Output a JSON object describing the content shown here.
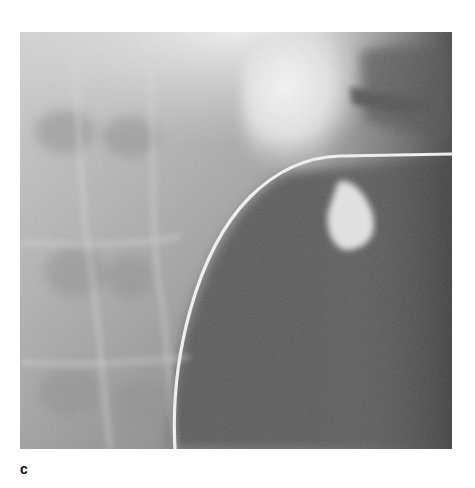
{
  "figure": {
    "panel_label": "c",
    "image_kind": "grayscale fluoroscopic radiograph",
    "content": {
      "catheter": "curved radiopaque wire/catheter crossing from lower center to upper right",
      "contrast_structure": "bright contrast-filled region upper right",
      "background": "abdominal soft tissue and bone shadows"
    },
    "colors": {
      "page_background": "#ffffff",
      "image_light": "#e6e6e6",
      "image_mid": "#9a9a9a",
      "image_dark": "#4a4a4a",
      "catheter": "#f2f2f2",
      "label": "#111111"
    }
  }
}
